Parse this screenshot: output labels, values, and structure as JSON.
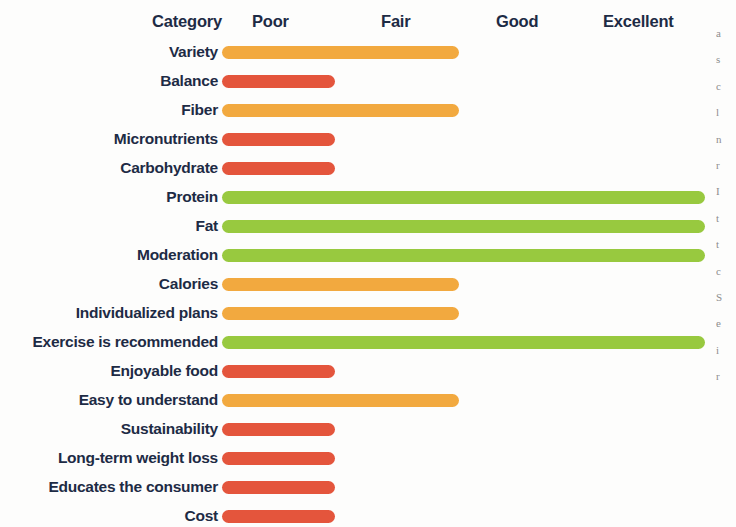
{
  "chart_data": {
    "type": "bar",
    "title": "",
    "subtitle": "",
    "xlabel": "",
    "ylabel": "Category",
    "orientation": "horizontal",
    "grid": false,
    "legend_position": "none",
    "scale_labels": [
      "Poor",
      "Fair",
      "Good",
      "Excellent"
    ],
    "scale_values": [
      1,
      2,
      3,
      4
    ],
    "xlim": [
      0,
      4
    ],
    "categories": [
      "Variety",
      "Balance",
      "Fiber",
      "Micronutrients",
      "Carbohydrate",
      "Protein",
      "Fat",
      "Moderation",
      "Calories",
      "Individualized plans",
      "Exercise is recommended",
      "Enjoyable food",
      "Easy to understand",
      "Sustainability",
      "Long-term weight loss",
      "Educates the consumer",
      "Cost"
    ],
    "values": [
      2,
      1,
      2,
      1,
      1,
      4,
      4,
      4,
      2,
      2,
      4,
      1,
      2,
      1,
      1,
      1,
      1
    ],
    "ratings": [
      "Fair",
      "Poor",
      "Fair",
      "Poor",
      "Poor",
      "Excellent",
      "Excellent",
      "Excellent",
      "Fair",
      "Fair",
      "Excellent",
      "Poor",
      "Fair",
      "Poor",
      "Poor",
      "Poor",
      "Poor"
    ],
    "colors": {
      "Poor": "#e4553c",
      "Fair": "#f2a93f",
      "Good": "#f2a93f",
      "Excellent": "#98c93f"
    },
    "bar_pixel_widths": [
      237,
      113,
      237,
      113,
      113,
      483,
      483,
      483,
      237,
      237,
      483,
      113,
      237,
      113,
      113,
      113,
      113
    ]
  },
  "header": {
    "category_label": "Category",
    "poor_label": "Poor",
    "fair_label": "Fair",
    "good_label": "Good",
    "excellent_label": "Excellent"
  },
  "rows": [
    {
      "label": "Variety",
      "rating": "Fair",
      "width": 237,
      "color": "#f2a93f"
    },
    {
      "label": "Balance",
      "rating": "Poor",
      "width": 113,
      "color": "#e4553c"
    },
    {
      "label": "Fiber",
      "rating": "Fair",
      "width": 237,
      "color": "#f2a93f"
    },
    {
      "label": "Micronutrients",
      "rating": "Poor",
      "width": 113,
      "color": "#e4553c"
    },
    {
      "label": "Carbohydrate",
      "rating": "Poor",
      "width": 113,
      "color": "#e4553c"
    },
    {
      "label": "Protein",
      "rating": "Excellent",
      "width": 483,
      "color": "#98c93f"
    },
    {
      "label": "Fat",
      "rating": "Excellent",
      "width": 483,
      "color": "#98c93f"
    },
    {
      "label": "Moderation",
      "rating": "Excellent",
      "width": 483,
      "color": "#98c93f"
    },
    {
      "label": "Calories",
      "rating": "Fair",
      "width": 237,
      "color": "#f2a93f"
    },
    {
      "label": "Individualized plans",
      "rating": "Fair",
      "width": 237,
      "color": "#f2a93f"
    },
    {
      "label": "Exercise is recommended",
      "rating": "Excellent",
      "width": 483,
      "color": "#98c93f"
    },
    {
      "label": "Enjoyable food",
      "rating": "Poor",
      "width": 113,
      "color": "#e4553c"
    },
    {
      "label": "Easy to understand",
      "rating": "Fair",
      "width": 237,
      "color": "#f2a93f"
    },
    {
      "label": "Sustainability",
      "rating": "Poor",
      "width": 113,
      "color": "#e4553c"
    },
    {
      "label": "Long-term weight loss",
      "rating": "Poor",
      "width": 113,
      "color": "#e4553c"
    },
    {
      "label": "Educates the consumer",
      "rating": "Poor",
      "width": 113,
      "color": "#e4553c"
    },
    {
      "label": "Cost",
      "rating": "Poor",
      "width": 113,
      "color": "#e4553c"
    }
  ],
  "margin_text_fragments": [
    "a",
    "s",
    "c",
    "",
    "",
    "",
    "",
    "l",
    "n",
    "r",
    "",
    "I",
    "t",
    "t",
    "c",
    "S",
    "e",
    "i",
    "r"
  ],
  "colors": {
    "label_text": "#1d2b45",
    "header_text": "#1d2b45",
    "background": "#fdfdfc",
    "poor": "#e4553c",
    "fair": "#f2a93f",
    "excellent": "#98c93f"
  }
}
